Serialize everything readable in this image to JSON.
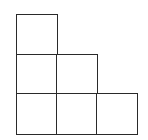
{
  "diagram": {
    "type": "staircase-grid",
    "rows": [
      1,
      2,
      3
    ],
    "cell_size_px": 40,
    "origin": {
      "x": 16,
      "y": 14
    },
    "line_color": "#2a2a2a",
    "fill_color": "#ffffff",
    "cells": [
      {
        "row": 0,
        "col": 0
      },
      {
        "row": 1,
        "col": 0
      },
      {
        "row": 1,
        "col": 1
      },
      {
        "row": 2,
        "col": 0
      },
      {
        "row": 2,
        "col": 1
      },
      {
        "row": 2,
        "col": 2
      }
    ]
  }
}
